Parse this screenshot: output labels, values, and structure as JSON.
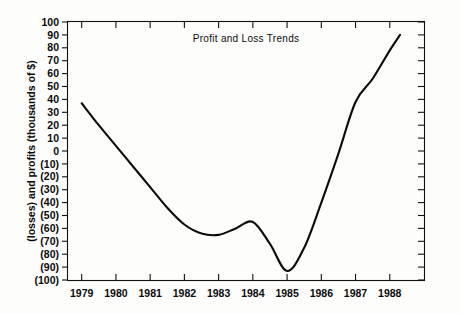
{
  "chart_data": {
    "type": "line",
    "title": "Profit and Loss Trends",
    "xlabel": "",
    "ylabel": "(losses) and profits (thousands of $)",
    "grid": false,
    "legend": "none",
    "xlim": [
      1978.6,
      1989.0
    ],
    "ylim": [
      -100,
      100
    ],
    "ytick_step": 10,
    "categories": [
      "1979",
      "1980",
      "1981",
      "1982",
      "1983",
      "1984",
      "1985",
      "1986",
      "1987",
      "1988"
    ],
    "x_tick_labels": [
      "1979",
      "1980",
      "1981",
      "1982",
      "1983",
      "1984",
      "1985",
      "1986",
      "1987",
      "1988"
    ],
    "y_tick_labels": [
      "100",
      "90",
      "80",
      "70",
      "60",
      "50",
      "40",
      "30",
      "20",
      "10",
      "0",
      "(10)",
      "(20)",
      "(30)",
      "(40)",
      "(50)",
      "(60)",
      "(70)",
      "(80)",
      "(90)",
      "(100)"
    ],
    "y_tick_values": [
      100,
      90,
      80,
      70,
      60,
      50,
      40,
      30,
      20,
      10,
      0,
      -10,
      -20,
      -30,
      -40,
      -50,
      -60,
      -70,
      -80,
      -90,
      -100
    ],
    "series": [
      {
        "name": "Profit and loss",
        "color": "#0a0a0a",
        "x": [
          1979.0,
          1979.5,
          1980.0,
          1980.5,
          1981.0,
          1981.5,
          1982.0,
          1982.5,
          1983.0,
          1983.5,
          1984.0,
          1984.5,
          1985.0,
          1985.5,
          1986.0,
          1986.5,
          1987.0,
          1987.5,
          1988.0,
          1988.3
        ],
        "values": [
          37,
          20,
          4,
          -12,
          -28,
          -44,
          -57,
          -64,
          -65,
          -60,
          -55,
          -72,
          -93,
          -75,
          -40,
          -2,
          38,
          56,
          78,
          90
        ]
      }
    ],
    "annotations": []
  },
  "figure": {
    "title_text": "Profit and Loss Trends",
    "y_axis_title": "(losses) and profits (thousands of $)"
  }
}
